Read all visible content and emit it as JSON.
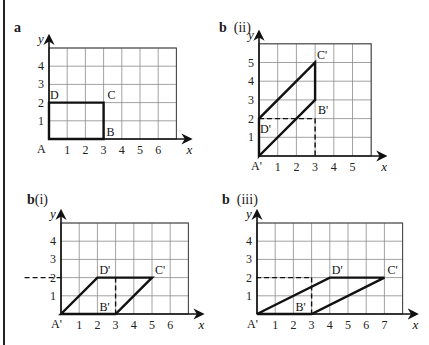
{
  "panels": [
    {
      "id": "a",
      "label": "a",
      "sublabel": "",
      "origin": [
        49,
        139
      ],
      "cell": 18.2,
      "cols": 7,
      "rows": 5,
      "x_ticks": [
        "1",
        "2",
        "3",
        "4",
        "5",
        "6"
      ],
      "y_ticks": [
        "1",
        "2",
        "3",
        "4"
      ],
      "axis_x": "x",
      "axis_y": "y",
      "shape": [
        [
          0,
          0
        ],
        [
          3,
          0
        ],
        [
          3,
          2
        ],
        [
          0,
          2
        ]
      ],
      "dashed": [],
      "vertices": [
        {
          "name": "A",
          "at": [
            0,
            0
          ],
          "dx": -12,
          "dy": 14
        },
        {
          "name": "B",
          "at": [
            3,
            0
          ],
          "dx": 3,
          "dy": -3
        },
        {
          "name": "C",
          "at": [
            3,
            2
          ],
          "dx": 4,
          "dy": -4
        },
        {
          "name": "D",
          "at": [
            0,
            2
          ],
          "dx": 1,
          "dy": -4
        }
      ]
    },
    {
      "id": "b-ii",
      "label": "b",
      "sublabel": "(ii)",
      "origin": [
        259,
        156
      ],
      "cell": 18.7,
      "cols": 6,
      "rows": 6,
      "x_ticks": [
        "1",
        "2",
        "3",
        "4",
        "5"
      ],
      "y_ticks": [
        "1",
        "2",
        "3",
        "4",
        "5"
      ],
      "axis_x": "x",
      "axis_y": "y",
      "shape": [
        [
          0,
          0
        ],
        [
          3,
          3
        ],
        [
          3,
          5
        ],
        [
          0,
          2
        ]
      ],
      "dashed": [
        [
          [
            0,
            2
          ],
          [
            3,
            2
          ]
        ],
        [
          [
            3,
            2
          ],
          [
            3,
            0
          ]
        ]
      ],
      "vertices": [
        {
          "name": "A'",
          "at": [
            0,
            0
          ],
          "dx": -8,
          "dy": 14
        },
        {
          "name": "B'",
          "at": [
            3,
            3
          ],
          "dx": 3,
          "dy": 14
        },
        {
          "name": "C'",
          "at": [
            3,
            5
          ],
          "dx": 2,
          "dy": -4
        },
        {
          "name": "D'",
          "at": [
            0,
            2
          ],
          "dx": 1,
          "dy": 14
        }
      ]
    },
    {
      "id": "b-i",
      "label": "b",
      "sublabel": "(i)",
      "origin": [
        61,
        314
      ],
      "cell": 18.2,
      "cols": 7,
      "rows": 5,
      "x_ticks": [
        "1",
        "2",
        "3",
        "4",
        "5",
        "6"
      ],
      "y_ticks": [
        "1",
        "2",
        "3",
        "4"
      ],
      "axis_x": "x",
      "axis_y": "y",
      "shape": [
        [
          0,
          0
        ],
        [
          3,
          0
        ],
        [
          5,
          2
        ],
        [
          2,
          2
        ]
      ],
      "dashed": [
        [
          [
            -2,
            2
          ],
          [
            0,
            2
          ]
        ],
        [
          [
            3,
            2
          ],
          [
            3,
            0
          ]
        ]
      ],
      "vertices": [
        {
          "name": "A'",
          "at": [
            0,
            0
          ],
          "dx": -10,
          "dy": 14
        },
        {
          "name": "B'",
          "at": [
            3,
            0
          ],
          "dx": -16,
          "dy": -3
        },
        {
          "name": "C'",
          "at": [
            5,
            2
          ],
          "dx": 3,
          "dy": -4
        },
        {
          "name": "D'",
          "at": [
            2,
            2
          ],
          "dx": 2,
          "dy": -4
        }
      ]
    },
    {
      "id": "b-iii",
      "label": "b",
      "sublabel": "(iii)",
      "origin": [
        257,
        314
      ],
      "cell": 18.2,
      "cols": 8,
      "rows": 5,
      "x_ticks": [
        "1",
        "2",
        "3",
        "4",
        "5",
        "6",
        "7"
      ],
      "y_ticks": [
        "1",
        "2",
        "3",
        "4"
      ],
      "axis_x": "x",
      "axis_y": "y",
      "shape": [
        [
          0,
          0
        ],
        [
          3,
          0
        ],
        [
          7,
          2
        ],
        [
          4,
          2
        ]
      ],
      "dashed": [
        [
          [
            -0.05,
            2
          ],
          [
            3,
            2
          ]
        ],
        [
          [
            3,
            2
          ],
          [
            3,
            0
          ]
        ]
      ],
      "vertices": [
        {
          "name": "A'",
          "at": [
            0,
            0
          ],
          "dx": -10,
          "dy": 14
        },
        {
          "name": "B'",
          "at": [
            3,
            0
          ],
          "dx": -16,
          "dy": -3
        },
        {
          "name": "C'",
          "at": [
            7,
            2
          ],
          "dx": 3,
          "dy": -4
        },
        {
          "name": "D'",
          "at": [
            4,
            2
          ],
          "dx": 2,
          "dy": -4
        }
      ]
    }
  ],
  "labels": {
    "a": {
      "main": "a",
      "sub": "",
      "x": 14,
      "y": 20
    },
    "b_ii": {
      "main": "b",
      "sub": "(ii)",
      "x": 219,
      "y": 20
    },
    "b_i": {
      "main": "b",
      "sub": "(i)",
      "x": 27,
      "y": 192
    },
    "b_iii": {
      "main": "b",
      "sub": "(iii)",
      "x": 222,
      "y": 192
    }
  }
}
